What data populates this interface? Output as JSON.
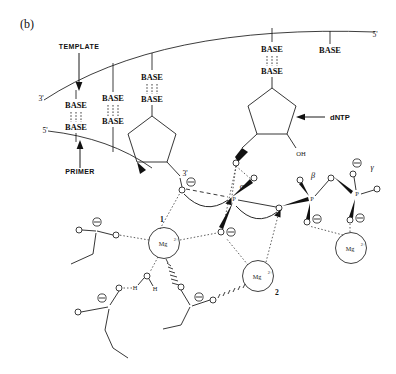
{
  "figure": {
    "panel_label": "(b)"
  },
  "annotations": {
    "template_label": "TEMPLATE",
    "primer_label": "PRIMER",
    "dntp_label": "dNTP",
    "template_3prime": "3'",
    "template_5prime_right": "5'",
    "primer_5prime": "5'",
    "sugar_3prime": "3'",
    "hydroxyl": "OH"
  },
  "base_pairs": [
    {
      "top": "BASE",
      "bottom": "BASE"
    },
    {
      "top": "BASE",
      "bottom": "BASE"
    },
    {
      "top": "BASE",
      "bottom": "BASE"
    },
    {
      "top": "BASE",
      "bottom": "BASE"
    },
    {
      "top": "BASE",
      "bottom": ""
    }
  ],
  "phosphates": [
    {
      "greek": "α",
      "atom": "P"
    },
    {
      "greek": "β",
      "atom": "P"
    },
    {
      "greek": "γ",
      "atom": "P"
    }
  ],
  "metals": [
    {
      "ion": "Mg",
      "charge": "2+",
      "site": "1"
    },
    {
      "ion": "Mg",
      "charge": "2+",
      "site": "2"
    },
    {
      "ion": "Mg",
      "charge": "2+",
      "site": ""
    }
  ],
  "atoms": {
    "oxygen": "O",
    "phosphorus": "P",
    "hydrogen": "H",
    "negative_charge": "⊖"
  },
  "water": {
    "h_left": "H",
    "o_center": "O",
    "h_right": "H"
  },
  "colors": {
    "background": "#ffffff",
    "line": "#1a1a1a",
    "text": "#111111",
    "wedge": "#111111"
  }
}
